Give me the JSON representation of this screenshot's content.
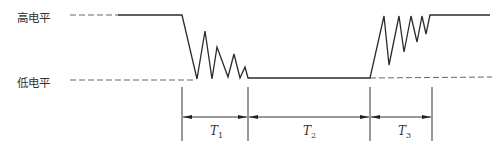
{
  "diagram": {
    "levels": {
      "high": "高电平",
      "low": "低电平"
    },
    "intervals": [
      {
        "symbol": "T",
        "subscript": "1",
        "meaning": "falling-edge bounce"
      },
      {
        "symbol": "T",
        "subscript": "2",
        "meaning": "stable low"
      },
      {
        "symbol": "T",
        "subscript": "3",
        "meaning": "rising-edge bounce"
      }
    ],
    "colors": {
      "signal": "#2a2a2a",
      "reference": "#666666",
      "text": "#333333"
    }
  }
}
